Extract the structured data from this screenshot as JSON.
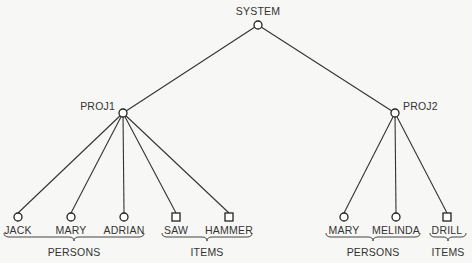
{
  "diagram": {
    "root": {
      "id": "system",
      "label": "SYSTEM",
      "x": 258,
      "y": 25,
      "shape": "circle"
    },
    "projects": [
      {
        "id": "proj1",
        "label": "PROJ1",
        "x": 123,
        "y": 113,
        "shape": "circle"
      },
      {
        "id": "proj2",
        "label": "PROJ2",
        "x": 395,
        "y": 113,
        "shape": "circle"
      }
    ],
    "leaves": [
      {
        "id": "jack",
        "label": "JACK",
        "x": 18,
        "parent": "proj1",
        "shape": "circle"
      },
      {
        "id": "mary1",
        "label": "MARY",
        "x": 71,
        "parent": "proj1",
        "shape": "circle"
      },
      {
        "id": "adrian",
        "label": "ADRIAN",
        "x": 124,
        "parent": "proj1",
        "shape": "circle"
      },
      {
        "id": "saw",
        "label": "SAW",
        "x": 176,
        "parent": "proj1",
        "shape": "square"
      },
      {
        "id": "hammer",
        "label": "HAMMER",
        "x": 229,
        "parent": "proj1",
        "shape": "square"
      },
      {
        "id": "mary2",
        "label": "MARY",
        "x": 344,
        "parent": "proj2",
        "shape": "circle"
      },
      {
        "id": "melinda",
        "label": "MELINDA",
        "x": 396,
        "parent": "proj2",
        "shape": "circle"
      },
      {
        "id": "drill",
        "label": "DRILL",
        "x": 447,
        "parent": "proj2",
        "shape": "square"
      }
    ],
    "groups": [
      {
        "id": "persons1",
        "label": "PERSONS",
        "x1": 4,
        "x2": 144
      },
      {
        "id": "items1",
        "label": "ITEMS",
        "x1": 162,
        "x2": 252
      },
      {
        "id": "persons2",
        "label": "PERSONS",
        "x1": 326,
        "x2": 420
      },
      {
        "id": "items2",
        "label": "ITEMS",
        "x1": 430,
        "x2": 466
      }
    ],
    "leaf_y": 217
  }
}
